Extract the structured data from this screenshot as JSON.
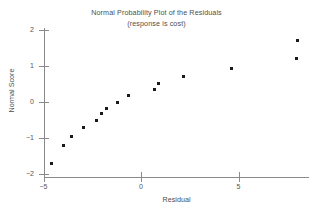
{
  "chart_data": {
    "type": "scatter",
    "title": "Normal Probability Plot of the Residuals",
    "subtitle": "(response is cost)",
    "xlabel": "Residual",
    "ylabel": "Normal Score",
    "xlim": [
      -5.6,
      8.6
    ],
    "ylim": [
      -2.05,
      2.1
    ],
    "xticks": [
      -5,
      0,
      5
    ],
    "xtick_labels": [
      "−5",
      "0",
      "5"
    ],
    "yticks": [
      2,
      1,
      0,
      -1,
      -2
    ],
    "ytick_labels": [
      "2",
      "1",
      "0",
      "−1",
      "−2"
    ],
    "grid": false,
    "legend": "none",
    "marker": "square",
    "marker_color": "#1a1a1a",
    "points": [
      {
        "x": -4.6,
        "y": -1.7
      },
      {
        "x": -4.0,
        "y": -1.2
      },
      {
        "x": -3.55,
        "y": -0.95
      },
      {
        "x": -2.95,
        "y": -0.7
      },
      {
        "x": -2.3,
        "y": -0.5
      },
      {
        "x": -2.05,
        "y": -0.31
      },
      {
        "x": -1.75,
        "y": -0.17
      },
      {
        "x": -1.2,
        "y": 0.0
      },
      {
        "x": -0.65,
        "y": 0.17
      },
      {
        "x": 0.7,
        "y": 0.36
      },
      {
        "x": 0.9,
        "y": 0.52
      },
      {
        "x": 2.2,
        "y": 0.72
      },
      {
        "x": 4.65,
        "y": 0.93
      },
      {
        "x": 7.95,
        "y": 1.21
      },
      {
        "x": 8.0,
        "y": 1.72
      }
    ]
  }
}
